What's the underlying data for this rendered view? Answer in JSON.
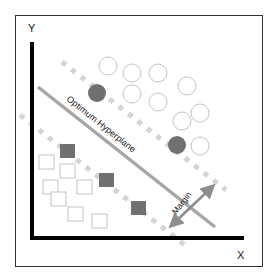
{
  "diagram": {
    "axes": {
      "y_label": "Y",
      "x_label": "X"
    },
    "labels": {
      "hyperplane": "Optimum Hyperplane",
      "margin": "Margin"
    },
    "colors": {
      "frame": "#333333",
      "axis": "#000000",
      "hyperplane": "#a6a6a6",
      "margin_dashes": "#d4d4d4",
      "filled_point": "#707070",
      "empty_point_stroke": "#c4c4c4",
      "margin_arrow": "#8c8c8c",
      "text": "#1a1a1a"
    },
    "class_circles": {
      "empty": [
        {
          "cx": 108,
          "cy": 66
        },
        {
          "cx": 132,
          "cy": 73
        },
        {
          "cx": 158,
          "cy": 73
        },
        {
          "cx": 187,
          "cy": 86
        },
        {
          "cx": 132,
          "cy": 94
        },
        {
          "cx": 158,
          "cy": 102
        },
        {
          "cx": 182,
          "cy": 121
        },
        {
          "cx": 200,
          "cy": 113
        },
        {
          "cx": 200,
          "cy": 146
        }
      ],
      "support_vectors": [
        {
          "cx": 97,
          "cy": 93
        },
        {
          "cx": 177,
          "cy": 145
        }
      ]
    },
    "class_squares": {
      "empty": [
        {
          "x": 39,
          "y": 155
        },
        {
          "x": 60,
          "y": 164
        },
        {
          "x": 43,
          "y": 180
        },
        {
          "x": 77,
          "y": 180
        },
        {
          "x": 51,
          "y": 192
        },
        {
          "x": 68,
          "y": 207
        },
        {
          "x": 92,
          "y": 214
        }
      ],
      "support_vectors": [
        {
          "x": 60,
          "y": 144
        },
        {
          "x": 99,
          "y": 173
        },
        {
          "x": 131,
          "y": 201
        }
      ]
    }
  }
}
